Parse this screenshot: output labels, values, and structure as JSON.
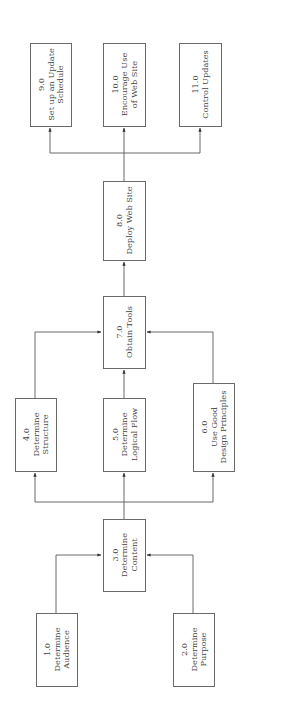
{
  "diagram": {
    "type": "flowchart",
    "orientation": "rotated 90 degrees counter-clockwise (flow reads bottom to top)",
    "nodes": [
      {
        "id": "1.0",
        "number": "1.0",
        "lines": [
          "Determine",
          "Audience"
        ]
      },
      {
        "id": "2.0",
        "number": "2.0",
        "lines": [
          "Determine",
          "Purpose"
        ]
      },
      {
        "id": "3.0",
        "number": "3.0",
        "lines": [
          "Determine",
          "Content"
        ]
      },
      {
        "id": "4.0",
        "number": "4.0",
        "lines": [
          "Determine",
          "Structure"
        ]
      },
      {
        "id": "5.0",
        "number": "5.0",
        "lines": [
          "Determine",
          "Logical Flow"
        ]
      },
      {
        "id": "6.0",
        "number": "6.0",
        "lines": [
          "Use Good",
          "Design Principles"
        ]
      },
      {
        "id": "7.0",
        "number": "7.0",
        "lines": [
          "Obtain Tools"
        ]
      },
      {
        "id": "8.0",
        "number": "8.0",
        "lines": [
          "Deploy Web Site"
        ]
      },
      {
        "id": "9.0",
        "number": "9.0",
        "lines": [
          "Set up an Update",
          "Schedule"
        ]
      },
      {
        "id": "10.0",
        "number": "10.0",
        "lines": [
          "Encourage Use",
          "of Web Site"
        ]
      },
      {
        "id": "11.0",
        "number": "11.0",
        "lines": [
          "Control Updates"
        ]
      }
    ],
    "edges": [
      {
        "from": "1.0",
        "to": "3.0"
      },
      {
        "from": "2.0",
        "to": "3.0"
      },
      {
        "from": "3.0",
        "to": "4.0"
      },
      {
        "from": "3.0",
        "to": "5.0"
      },
      {
        "from": "3.0",
        "to": "6.0"
      },
      {
        "from": "4.0",
        "to": "7.0"
      },
      {
        "from": "5.0",
        "to": "7.0"
      },
      {
        "from": "6.0",
        "to": "7.0"
      },
      {
        "from": "7.0",
        "to": "8.0"
      },
      {
        "from": "8.0",
        "to": "9.0"
      },
      {
        "from": "8.0",
        "to": "10.0"
      },
      {
        "from": "8.0",
        "to": "11.0"
      }
    ]
  }
}
